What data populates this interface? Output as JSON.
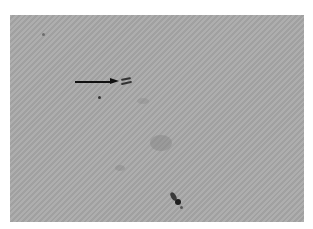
{
  "image": {
    "type": "grayscale light micrograph",
    "background_color": "#a9a9a9",
    "annotation": {
      "kind": "arrow",
      "direction": "right",
      "color": "#111111",
      "points_to": "pair of small rod-shaped cells"
    },
    "features": [
      {
        "name": "rod-pair",
        "x": 121,
        "y": 80
      },
      {
        "name": "dark-dot",
        "x": 99,
        "y": 97
      },
      {
        "name": "speck-top-left",
        "x": 43,
        "y": 34
      },
      {
        "name": "faint-smudge-center",
        "x": 158,
        "y": 145
      },
      {
        "name": "dark-debris-bottom",
        "x": 176,
        "y": 199
      }
    ]
  }
}
